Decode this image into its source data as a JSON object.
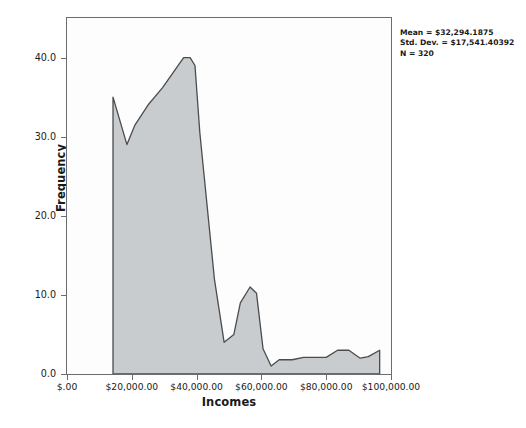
{
  "chart_data": {
    "type": "area",
    "title": "",
    "subtitle": "",
    "xlabel": "Incomes",
    "ylabel": "Frequency",
    "xlim": [
      0,
      100000
    ],
    "ylim": [
      0,
      45
    ],
    "grid": false,
    "legend": "none",
    "xtick_values": [
      0,
      20000,
      40000,
      60000,
      80000,
      100000
    ],
    "xtick_labels": [
      "$.00",
      "$20,000.00",
      "$40,000.00",
      "$60,000.00",
      "$80,000.00",
      "$100,000.00"
    ],
    "ytick_values": [
      0,
      10,
      20,
      30,
      40
    ],
    "ytick_labels": [
      "0.0",
      "10.0",
      "20.0",
      "30.0",
      "40.0"
    ],
    "series": [
      {
        "name": "Incomes frequency polygon",
        "x": [
          14200,
          14200,
          18500,
          21000,
          25000,
          29500,
          36000,
          38000,
          39500,
          41000,
          45500,
          48500,
          51500,
          53500,
          56500,
          58500,
          60500,
          63000,
          65500,
          69500,
          73000,
          76500,
          80000,
          83500,
          87000,
          90500,
          93000,
          96500,
          96500
        ],
        "values": [
          0,
          35.0,
          29.0,
          31.5,
          34.0,
          36.2,
          40.0,
          40.0,
          39.0,
          30.5,
          12.0,
          4.0,
          5.0,
          9.0,
          11.0,
          10.2,
          3.2,
          1.0,
          1.8,
          1.8,
          2.1,
          2.1,
          2.1,
          3.0,
          3.0,
          2.0,
          2.2,
          3.0,
          0
        ],
        "fill_color": "#c9ccce",
        "line_color": "#4a4c4e"
      }
    ],
    "annotations": {
      "mean": "Mean = $32,294.1875",
      "std_dev": "Std. Dev. = $17,541.40392",
      "n": "N = 320"
    }
  },
  "axes": {
    "y_title": "Frequency",
    "x_title": "Incomes"
  },
  "colors": {
    "fill": "#c9ccce",
    "outline": "#4a4c4e",
    "frame": "#6a6c6e",
    "text": "#1a1a1a",
    "background": "#ffffff"
  }
}
